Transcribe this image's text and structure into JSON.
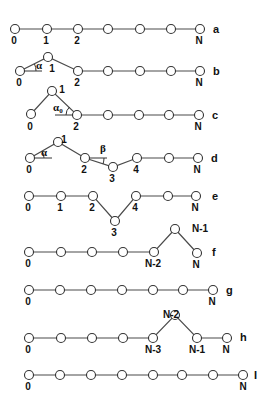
{
  "style": {
    "bond_color": "#4a4a4a",
    "atom_stroke": "#333333",
    "atom_fill": "#ffffff",
    "text_color": "#111111",
    "atom_radius": 4.5
  },
  "rows": [
    {
      "id": "a",
      "label": "a",
      "label_pos": [
        213,
        33
      ],
      "nodes": [
        [
          15,
          29
        ],
        [
          47,
          29
        ],
        [
          78,
          29
        ],
        [
          108,
          29
        ],
        [
          140,
          29
        ],
        [
          171,
          29
        ],
        [
          200,
          29
        ]
      ],
      "node_labels": [
        {
          "text": "0",
          "x": 14,
          "y": 44
        },
        {
          "text": "1",
          "x": 46,
          "y": 44
        },
        {
          "text": "2",
          "x": 77,
          "y": 44
        },
        {
          "text": "N",
          "x": 199,
          "y": 44
        }
      ],
      "angles": []
    },
    {
      "id": "b",
      "label": "b",
      "label_pos": [
        213,
        75
      ],
      "nodes": [
        [
          20,
          71
        ],
        [
          48,
          57
        ],
        [
          78,
          71
        ],
        [
          108,
          71
        ],
        [
          140,
          71
        ],
        [
          171,
          71
        ],
        [
          200,
          71
        ]
      ],
      "node_labels": [
        {
          "text": "0",
          "x": 19,
          "y": 86
        },
        {
          "text": "1",
          "x": 52,
          "y": 72
        },
        {
          "text": "2",
          "x": 77,
          "y": 86
        },
        {
          "text": "N",
          "x": 199,
          "y": 86
        }
      ],
      "angles": [
        {
          "symbol": "α",
          "subscript": "",
          "vertex": [
            20,
            71
          ],
          "ref_end": [
            42,
            71
          ],
          "arc": "M 36 71 A 16 16 0 0 0 34.5 64",
          "label_pos": [
            36,
            69
          ]
        }
      ]
    },
    {
      "id": "c",
      "label": "c",
      "label_pos": [
        212,
        119
      ],
      "nodes": [
        [
          31,
          114
        ],
        [
          52,
          91
        ],
        [
          77,
          115
        ],
        [
          108,
          115
        ],
        [
          139,
          115
        ],
        [
          169,
          115
        ],
        [
          199,
          115
        ]
      ],
      "node_labels": [
        {
          "text": "1",
          "x": 62,
          "y": 93
        },
        {
          "text": "0",
          "x": 30,
          "y": 130
        },
        {
          "text": "2",
          "x": 76,
          "y": 130
        },
        {
          "text": "N",
          "x": 198,
          "y": 130
        }
      ],
      "angles": [
        {
          "symbol": "α",
          "subscript": "0",
          "vertex": [
            77,
            115
          ],
          "ref_end": [
            55,
            115
          ],
          "arc": "M 66 115 A 11 11 0 0 1 69.5 107",
          "label_pos": [
            53,
            111
          ]
        }
      ]
    },
    {
      "id": "d",
      "label": "d",
      "label_pos": [
        211,
        162
      ],
      "nodes": [
        [
          30,
          158
        ],
        [
          58,
          142
        ],
        [
          85,
          158
        ],
        [
          113,
          167
        ],
        [
          137,
          158
        ],
        [
          169,
          158
        ],
        [
          198,
          158
        ]
      ],
      "node_labels": [
        {
          "text": "1",
          "x": 64,
          "y": 143
        },
        {
          "text": "0",
          "x": 29,
          "y": 173
        },
        {
          "text": "2",
          "x": 84,
          "y": 173
        },
        {
          "text": "3",
          "x": 112,
          "y": 182
        },
        {
          "text": "4",
          "x": 136,
          "y": 173
        },
        {
          "text": "N",
          "x": 197,
          "y": 173
        }
      ],
      "angles": [
        {
          "symbol": "α",
          "subscript": "",
          "vertex": [
            30,
            158
          ],
          "ref_end": [
            52,
            158
          ],
          "arc": "M 44 158 A 14 14 0 0 0 42 151",
          "label_pos": [
            41,
            156
          ]
        },
        {
          "symbol": "β",
          "subscript": "",
          "vertex": [
            85,
            158
          ],
          "ref_end": [
            107,
            158
          ],
          "arc": "M 104 158 A 19 19 0 0 1 103 164",
          "label_pos": [
            100,
            152
          ]
        }
      ]
    },
    {
      "id": "e",
      "label": "e",
      "label_pos": [
        212,
        200
      ],
      "nodes": [
        [
          29,
          196
        ],
        [
          61,
          196
        ],
        [
          93,
          196
        ],
        [
          115,
          221
        ],
        [
          136,
          196
        ],
        [
          168,
          196
        ],
        [
          196,
          196
        ]
      ],
      "node_labels": [
        {
          "text": "0",
          "x": 28,
          "y": 211
        },
        {
          "text": "1",
          "x": 60,
          "y": 211
        },
        {
          "text": "2",
          "x": 92,
          "y": 211
        },
        {
          "text": "3",
          "x": 114,
          "y": 236
        },
        {
          "text": "4",
          "x": 135,
          "y": 211
        },
        {
          "text": "N",
          "x": 195,
          "y": 211
        }
      ],
      "angles": []
    },
    {
      "id": "f",
      "label": "f",
      "label_pos": [
        212,
        256
      ],
      "nodes": [
        [
          29,
          252
        ],
        [
          61,
          252
        ],
        [
          92,
          252
        ],
        [
          123,
          252
        ],
        [
          154,
          252
        ],
        [
          175,
          229
        ],
        [
          197,
          253
        ]
      ],
      "node_labels": [
        {
          "text": "N-1",
          "x": 192,
          "y": 232
        },
        {
          "text": "0",
          "x": 28,
          "y": 267
        },
        {
          "text": "N-2",
          "x": 153,
          "y": 267
        },
        {
          "text": "N",
          "x": 196,
          "y": 268
        }
      ],
      "angles": []
    },
    {
      "id": "g",
      "label": "g",
      "label_pos": [
        226,
        294
      ],
      "nodes": [
        [
          29,
          290
        ],
        [
          60,
          290
        ],
        [
          91,
          290
        ],
        [
          122,
          290
        ],
        [
          153,
          290
        ],
        [
          183,
          290
        ],
        [
          213,
          290
        ]
      ],
      "node_labels": [
        {
          "text": "0",
          "x": 28,
          "y": 305
        },
        {
          "text": "N",
          "x": 212,
          "y": 305
        }
      ],
      "angles": []
    },
    {
      "id": "h",
      "label": "h",
      "label_pos": [
        240,
        341
      ],
      "nodes": [
        [
          29,
          338
        ],
        [
          61,
          338
        ],
        [
          92,
          338
        ],
        [
          123,
          338
        ],
        [
          153,
          338
        ],
        [
          175,
          315
        ],
        [
          197,
          338
        ],
        [
          227,
          338
        ]
      ],
      "node_labels": [
        {
          "text": "N-2",
          "x": 163,
          "y": 318
        },
        {
          "text": "0",
          "x": 28,
          "y": 353
        },
        {
          "text": "N-3",
          "x": 153,
          "y": 353
        },
        {
          "text": "N-1",
          "x": 197,
          "y": 353
        },
        {
          "text": "N",
          "x": 226,
          "y": 353
        }
      ],
      "angles": []
    },
    {
      "id": "i",
      "label": "I",
      "label_pos": [
        254,
        379
      ],
      "nodes": [
        [
          29,
          375
        ],
        [
          60,
          375
        ],
        [
          91,
          375
        ],
        [
          122,
          375
        ],
        [
          153,
          375
        ],
        [
          182,
          375
        ],
        [
          213,
          375
        ],
        [
          243,
          375
        ]
      ],
      "node_labels": [
        {
          "text": "0",
          "x": 28,
          "y": 390
        },
        {
          "text": "N",
          "x": 243,
          "y": 390
        }
      ],
      "angles": []
    }
  ]
}
